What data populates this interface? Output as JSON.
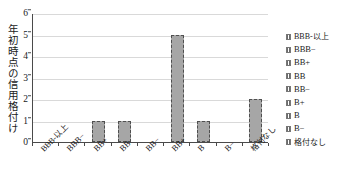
{
  "chart_data": {
    "type": "bar",
    "title": "",
    "xlabel": "",
    "ylabel": "年初時点の信用格付け",
    "categories": [
      "BBB-以上",
      "BBB−",
      "BB+",
      "BB",
      "BB−",
      "BB+",
      "B",
      "B−",
      "格付なし"
    ],
    "values": [
      0,
      0,
      1,
      1,
      0,
      5,
      1,
      0,
      2
    ],
    "ylim": [
      0,
      6
    ],
    "yticks": [
      0,
      1,
      2,
      3,
      4,
      5,
      6
    ],
    "ytick_labels": [
      "0",
      "1",
      "2",
      "3",
      "4",
      "5",
      "6"
    ],
    "grid": true,
    "legend_position": "right",
    "legend": [
      "BBB-以上",
      "BBB−",
      "BB+",
      "BB",
      "BB−",
      "B+",
      "B",
      "B−",
      "格付なし"
    ],
    "bar_color": "#a6a6a6",
    "bar_border_color": "#4f4f4f",
    "axis_color": "#4a4a4a",
    "grid_color": "#d9d9d9"
  }
}
